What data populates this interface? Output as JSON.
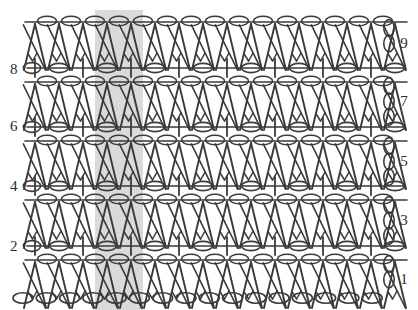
{
  "chart_data": {
    "type": "diagram",
    "subtitle": "V-stitch and mesh alternating pattern",
    "xlabel": "",
    "ylabel": "",
    "grid": false,
    "legend_position": "none",
    "geometry": {
      "width": 418,
      "height": 310,
      "stitch_pitch": 24.0,
      "stitch_origin_x": 35.0,
      "stitch_count": 15
    },
    "colors": {
      "ink": "#2b2b2b",
      "stroke": "#3a3a3a",
      "repeat_band": "#d4d4d4",
      "background": "#ffffff"
    },
    "repeat_band": {
      "label": "one pattern repeat",
      "x": 95,
      "width": 48,
      "y": 10,
      "height": 300
    },
    "row_numbers_left": [
      {
        "label": "8",
        "x": 10,
        "y": 68
      },
      {
        "label": "6",
        "x": 10,
        "y": 125
      },
      {
        "label": "4",
        "x": 10,
        "y": 185
      },
      {
        "label": "2",
        "x": 10,
        "y": 245
      }
    ],
    "row_numbers_right": [
      {
        "label": "9",
        "x": 404,
        "y": 42
      },
      {
        "label": "7",
        "x": 404,
        "y": 100
      },
      {
        "label": "5",
        "x": 404,
        "y": 160
      },
      {
        "label": "3",
        "x": 404,
        "y": 219
      },
      {
        "label": "1",
        "x": 404,
        "y": 278
      }
    ],
    "rows": [
      {
        "number": 9,
        "type": "v-stitch",
        "baseline": 22,
        "apex": 48,
        "symbol": "crossed-double-crochet",
        "chain_between": true
      },
      {
        "number": 8,
        "type": "mesh",
        "baseline": 68,
        "symbol": "single-crochet-and-chain",
        "alternating": [
          "+",
          "o"
        ]
      },
      {
        "number": 7,
        "type": "v-stitch",
        "baseline": 82,
        "apex": 108,
        "symbol": "crossed-double-crochet",
        "chain_between": true
      },
      {
        "number": 6,
        "type": "mesh",
        "baseline": 127,
        "symbol": "single-crochet-and-chain",
        "alternating": [
          "+",
          "o"
        ]
      },
      {
        "number": 5,
        "type": "v-stitch",
        "baseline": 141,
        "apex": 167,
        "symbol": "crossed-double-crochet",
        "chain_between": true
      },
      {
        "number": 4,
        "type": "mesh",
        "baseline": 186,
        "symbol": "single-crochet-and-chain",
        "alternating": [
          "+",
          "o"
        ]
      },
      {
        "number": 3,
        "type": "v-stitch",
        "baseline": 200,
        "apex": 226,
        "symbol": "crossed-double-crochet",
        "chain_between": true
      },
      {
        "number": 2,
        "type": "mesh",
        "baseline": 246,
        "symbol": "single-crochet-and-chain",
        "alternating": [
          "+",
          "o"
        ]
      },
      {
        "number": 1,
        "type": "v-stitch",
        "baseline": 260,
        "apex": 286,
        "symbol": "crossed-double-crochet",
        "chain_between": true
      }
    ],
    "foundation_chain": {
      "label": "foundation chain",
      "y": 298,
      "count": 16,
      "symbol": "chain-oval"
    },
    "turning_chains_right": [
      {
        "row": 9,
        "y": 28,
        "count": 2
      },
      {
        "row": 7,
        "y": 86,
        "count": 3
      },
      {
        "row": 5,
        "y": 146,
        "count": 3
      },
      {
        "row": 3,
        "y": 205,
        "count": 3
      },
      {
        "row": 1,
        "y": 264,
        "count": 2
      }
    ],
    "turning_chains_left": [
      {
        "row": 8,
        "y": 68
      },
      {
        "row": 6,
        "y": 127
      },
      {
        "row": 4,
        "y": 186
      },
      {
        "row": 2,
        "y": 246
      }
    ]
  }
}
